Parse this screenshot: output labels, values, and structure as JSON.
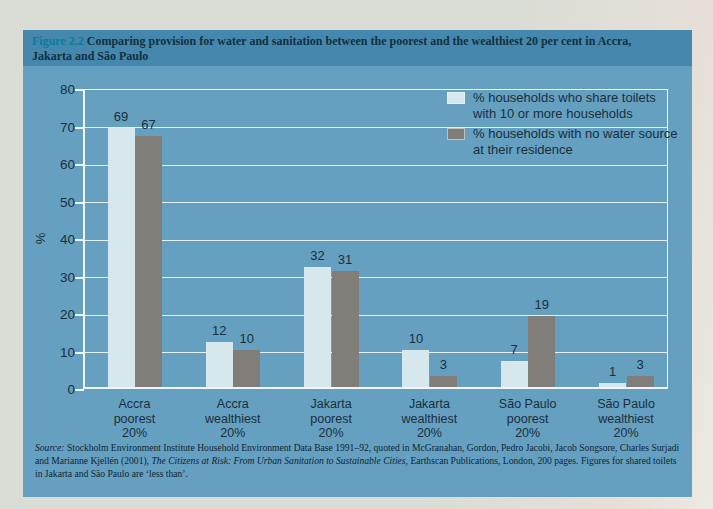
{
  "figure": {
    "label": "Figure 2.2",
    "title": "Comparing provision for water and sanitation between the poorest and the wealthiest 20 per cent in Accra, Jakarta and São Paulo"
  },
  "chart_data": {
    "type": "bar",
    "title": "Comparing provision for water and sanitation between the poorest and the wealthiest 20 per cent in Accra, Jakarta and São Paulo",
    "categories": [
      [
        "Accra",
        "poorest",
        "20%"
      ],
      [
        "Accra",
        "wealthiest",
        "20%"
      ],
      [
        "Jakarta",
        "poorest",
        "20%"
      ],
      [
        "Jakarta",
        "wealthiest",
        "20%"
      ],
      [
        "São Paulo",
        "poorest",
        "20%"
      ],
      [
        "São Paulo",
        "wealthiest",
        "20%"
      ]
    ],
    "series": [
      {
        "name": "% households who share toilets with 10 or more households",
        "legend_lines": [
          "% households who share toilets",
          "with 10 or more households"
        ],
        "color": "#d6e7ee",
        "values": [
          69,
          12,
          32,
          10,
          7,
          1
        ]
      },
      {
        "name": "% households with no water source at their residence",
        "legend_lines": [
          "% households with no water source",
          "at their residence"
        ],
        "color": "#817d78",
        "values": [
          67,
          10,
          31,
          3,
          19,
          3
        ]
      }
    ],
    "xlabel": "",
    "ylabel": "%",
    "ylim": [
      0,
      80
    ],
    "ytick_step": 10,
    "grid": true,
    "legend_position": "top-right"
  },
  "source": {
    "segments": [
      {
        "text": "Source:",
        "italic": true
      },
      {
        "text": " Stockholm Environment Institute Household Environment Data Base 1991–92, quoted in McGranahan, Gordon, Pedro Jacobi, Jacob Songsore, Charles Surjadi and Marianne Kjellén (2001), ",
        "italic": false
      },
      {
        "text": "The Citizens at Risk: From Urban Sanitation to Sustainable Cities",
        "italic": true
      },
      {
        "text": ", Earthscan Publications, London, 200 pages. Figures for shared toilets in Jakarta and São Paulo are ‘less than’.",
        "italic": false
      }
    ]
  },
  "colors": {
    "background": "#d9ddd5",
    "header_band": "#4687ae",
    "panel": "#65a0c1",
    "figure_label": "#0b7d9e",
    "title_text": "#12303f",
    "chart_text": "#1a2e3a",
    "gridline": "#f0f6f7",
    "source_text": "#0e2534"
  }
}
